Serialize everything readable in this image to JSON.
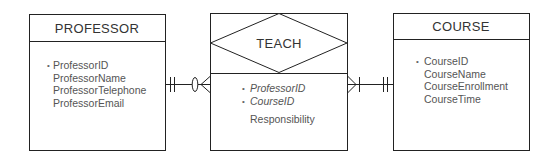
{
  "diagram": {
    "type": "ER diagram",
    "entities": [
      {
        "name": "PROFESSOR",
        "attributes": [
          {
            "label": "ProfessorID",
            "key": true
          },
          {
            "label": "ProfessorName",
            "key": false
          },
          {
            "label": "ProfessorTelephone",
            "key": false
          },
          {
            "label": "ProfessorEmail",
            "key": false
          }
        ]
      },
      {
        "name": "TEACH",
        "kind": "associative",
        "attributes": [
          {
            "label": "ProfessorID",
            "key": true,
            "foreign": true
          },
          {
            "label": "CourseID",
            "key": true,
            "foreign": true
          },
          {
            "label": "Responsibility",
            "key": false
          }
        ]
      },
      {
        "name": "COURSE",
        "attributes": [
          {
            "label": "CourseID",
            "key": true
          },
          {
            "label": "CourseName",
            "key": false
          },
          {
            "label": "CourseEnrollment",
            "key": false
          },
          {
            "label": "CourseTime",
            "key": false
          }
        ]
      }
    ],
    "relationships": [
      {
        "from": "PROFESSOR",
        "to": "TEACH",
        "from_cardinality": "one-and-only-one",
        "to_cardinality": "zero-or-many"
      },
      {
        "from": "TEACH",
        "to": "COURSE",
        "from_cardinality": "one-or-many",
        "to_cardinality": "one-and-only-one"
      }
    ],
    "bullet_glyph": "•",
    "colors": {
      "line": "#222222",
      "text": "#444444",
      "background": "#ffffff"
    }
  }
}
